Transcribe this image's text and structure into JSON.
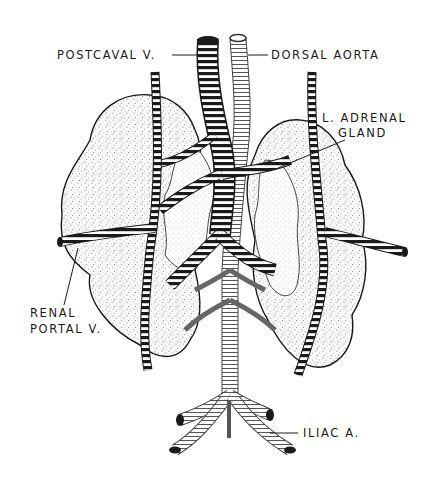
{
  "figure": {
    "labels": {
      "postcaval": "POSTCAVAL V.",
      "dorsal_aorta": "DORSAL AORTA",
      "adrenal_line1": "L. ADRENAL",
      "adrenal_line2": "GLAND",
      "renal_portal_line1": "RENAL",
      "renal_portal_line2": "PORTAL V.",
      "iliac": "ILIAC A."
    },
    "colors": {
      "ink": "#1a1a1a",
      "paper": "#ffffff",
      "stipple": "#9a9a9a"
    }
  }
}
